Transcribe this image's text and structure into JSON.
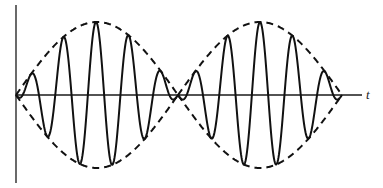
{
  "figure": {
    "axis_label_t": "t"
  },
  "chart_data": {
    "type": "line",
    "title": "",
    "xlabel": "t",
    "ylabel": "",
    "grid": false,
    "legend": null,
    "origin_px": [
      16,
      95
    ],
    "x_axis_end_px": 362,
    "y_axis_px": [
      5,
      183
    ],
    "envelope_amplitude_px": 73,
    "lobes": [
      {
        "start_px": 16,
        "end_px": 178,
        "center_px": 96
      },
      {
        "start_px": 178,
        "end_px": 342,
        "center_px": 260
      }
    ],
    "carrier_period_px": 32.6,
    "series": [
      {
        "name": "envelope (+)",
        "style": "dashed",
        "shape": "+A|sin(pi t / T)|"
      },
      {
        "name": "envelope (-)",
        "style": "dashed",
        "shape": "-A|sin(pi t / T)|"
      },
      {
        "name": "carrier",
        "style": "solid",
        "shape": "A|sin(pi t / T)| * cos(omega t)",
        "peaks_px_x": [
          33,
          63,
          95,
          128,
          161,
          193,
          227,
          260,
          293,
          325
        ],
        "troughs_px_x": [
          48,
          80,
          113,
          147,
          210,
          243,
          277,
          310
        ]
      }
    ]
  }
}
